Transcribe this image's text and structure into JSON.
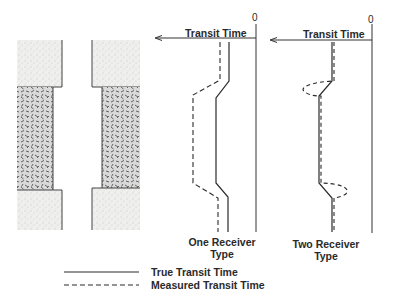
{
  "diagram": {
    "type": "borehole transit time schematic",
    "borehole": {
      "formations": [
        "hard formation (top)",
        "washout / soft zone (middle)",
        "hard formation (bottom)"
      ]
    },
    "panels": [
      {
        "id": "one-receiver",
        "axis_label": "Transit Time",
        "origin_label": "0",
        "caption_line1": "One Receiver",
        "caption_line2": "Type"
      },
      {
        "id": "two-receiver",
        "axis_label": "Transit Time",
        "origin_label": "0",
        "caption_line1": "Two Receiver",
        "caption_line2": "Type"
      }
    ],
    "legend": [
      {
        "style": "solid",
        "label": "True Transit Time"
      },
      {
        "style": "dashed",
        "label": "Measured Transit Time"
      }
    ],
    "colors": {
      "ink": "#2a2a2a",
      "rock_fill": "#e8e8e6",
      "washout_fill": "#bdbdbd"
    }
  }
}
